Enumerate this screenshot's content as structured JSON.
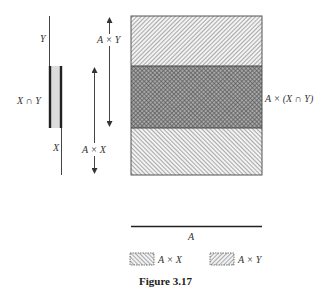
{
  "figure": {
    "caption": "Figure 3.17",
    "set_labels": {
      "y": "Y",
      "x_intersect_y": "X ∩ Y",
      "x": "X",
      "a_times_y": "A × Y",
      "a_times_x": "A × X",
      "a_times_intersection": "A × (X ∩ Y)",
      "a": "A"
    },
    "legend": [
      {
        "label": "A × X",
        "pattern": "hatch-backslash"
      },
      {
        "label": "A × Y",
        "pattern": "hatch-forward-slash"
      }
    ],
    "bands": [
      {
        "name": "A × Y only",
        "pattern": "hatch-forward-slash"
      },
      {
        "name": "A × (X ∩ Y)",
        "pattern": "crosshatch"
      },
      {
        "name": "A × X only",
        "pattern": "hatch-backslash"
      }
    ],
    "colors": {
      "ink": "#333333",
      "intersection_fill": "#d9d9d9",
      "hatch": "#8a8a8a",
      "crosshatch": "#555555"
    }
  }
}
